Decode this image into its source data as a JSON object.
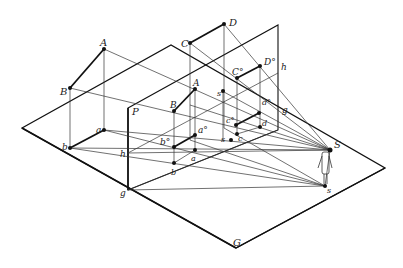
{
  "diagram": {
    "colors": {
      "line": "#333333",
      "background": "#ffffff"
    },
    "labels": {
      "A": "A",
      "B": "B",
      "C": "C",
      "D": "D",
      "a": "a",
      "b": "b",
      "P": "P",
      "G": "G",
      "h_left": "h",
      "h_mid": "h",
      "h_right": "h",
      "g_left": "g",
      "g_right": "g",
      "A_pic": "A",
      "B_pic": "B",
      "C0": "C°",
      "D0": "D°",
      "a0": "a°",
      "b0": "b°",
      "c0": "c°",
      "d0": "d°",
      "s_prime": "s'",
      "a_g": "a",
      "a_g_sub": "g",
      "b_g": "b",
      "b_g_sub": "g",
      "c_g": "c",
      "c_g_sub": "g",
      "d_g": "d",
      "d_g_sub": "g",
      "s_g": "s",
      "s_g_sub": "g",
      "S": "S",
      "s": "s"
    },
    "elements": {
      "ground_plane": "G",
      "picture_plane": "P",
      "station_point": "S",
      "observer_figure": "standing-person-icon"
    }
  }
}
